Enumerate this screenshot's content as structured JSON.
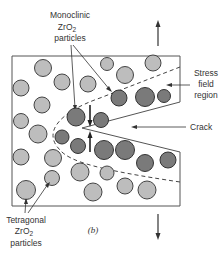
{
  "labels": {
    "monoclinic": [
      "Monoclinic",
      "ZrO",
      "2",
      "particles"
    ],
    "tetragonal": [
      "Tetragonal",
      "ZrO",
      "2",
      "particles"
    ],
    "stress": [
      "Stress",
      "field",
      "region"
    ],
    "crack": "Crack",
    "caption": "(b)"
  },
  "colors": {
    "tetragonal_fill": "#bdbdbd",
    "monoclinic_fill": "#7a7a7a",
    "stroke": "#444444"
  }
}
